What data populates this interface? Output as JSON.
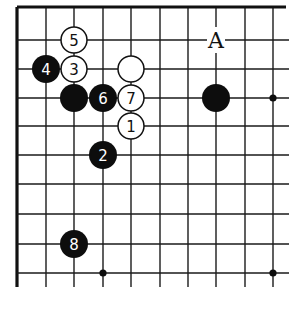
{
  "diagram": {
    "type": "go-board-fragment",
    "colors": {
      "black": "#0d0d0d",
      "white": "#ffffff",
      "line": "#1a1a1a"
    },
    "grid": {
      "x_lines": [
        17,
        46,
        74,
        103,
        131,
        160,
        188,
        216,
        245,
        273
      ],
      "y_lines": [
        7,
        40,
        69,
        98,
        126,
        155,
        184,
        214,
        244,
        273
      ],
      "line_x_end": 289,
      "line_y_end": 287,
      "border": {
        "top": true,
        "left": true,
        "right": false,
        "bottom": false
      }
    },
    "star_points": [
      {
        "col": 9,
        "row": 3
      },
      {
        "col": 3,
        "row": 9
      },
      {
        "col": 9,
        "row": 9
      }
    ],
    "stones": [
      {
        "color": "white",
        "col": 4,
        "row": 4,
        "number": "1"
      },
      {
        "color": "black",
        "col": 3,
        "row": 5,
        "number": "2"
      },
      {
        "color": "white",
        "col": 2,
        "row": 2,
        "number": "3"
      },
      {
        "color": "black",
        "col": 1,
        "row": 2,
        "number": "4"
      },
      {
        "color": "white",
        "col": 2,
        "row": 1,
        "number": "5"
      },
      {
        "color": "black",
        "col": 3,
        "row": 3,
        "number": "6"
      },
      {
        "color": "white",
        "col": 4,
        "row": 3,
        "number": "7"
      },
      {
        "color": "black",
        "col": 2,
        "row": 8,
        "number": "8"
      },
      {
        "color": "white",
        "col": 4,
        "row": 2,
        "number": ""
      },
      {
        "color": "black",
        "col": 2,
        "row": 3,
        "number": ""
      },
      {
        "color": "black",
        "col": 7,
        "row": 3,
        "number": ""
      }
    ],
    "labels": [
      {
        "text": "A",
        "col": 7,
        "row": 1
      }
    ]
  }
}
